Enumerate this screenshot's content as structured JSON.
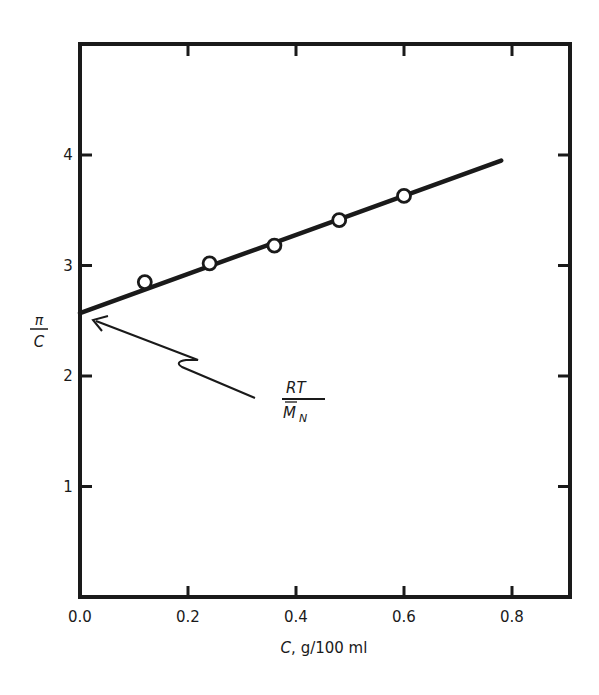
{
  "chart_data": {
    "type": "scatter",
    "title": "",
    "xlabel": "C, g/100 ml",
    "xlabel_var": "C",
    "xlabel_units": ", g/100 ml",
    "ylabel": "π/C",
    "ylabel_num": "π",
    "ylabel_den": "C",
    "xlim": [
      0.0,
      0.9
    ],
    "ylim": [
      0,
      5
    ],
    "x_ticks": [
      "0.0",
      "0.2",
      "0.4",
      "0.6",
      "0.8"
    ],
    "x_tick_values": [
      0.0,
      0.2,
      0.4,
      0.6,
      0.8
    ],
    "y_ticks": [
      "1",
      "2",
      "3",
      "4"
    ],
    "y_tick_values": [
      1,
      2,
      3,
      4
    ],
    "grid": false,
    "legend": null,
    "series": [
      {
        "name": "measured",
        "marker": "open-circle",
        "x": [
          0.12,
          0.24,
          0.36,
          0.48,
          0.6
        ],
        "y": [
          2.85,
          3.02,
          3.18,
          3.41,
          3.63
        ]
      },
      {
        "name": "linear fit",
        "style": "solid-line",
        "x": [
          0.0,
          0.78
        ],
        "y": [
          2.57,
          3.95
        ]
      }
    ],
    "annotations": [
      {
        "text_num": "RT",
        "text_den": "M̄N",
        "text_den_main": "M",
        "text_den_sub": "N",
        "label": "RT/M̄N",
        "points_to": {
          "x": 0.0,
          "y": 2.57
        },
        "description": "intercept equals RT / number-average molecular weight"
      }
    ]
  }
}
